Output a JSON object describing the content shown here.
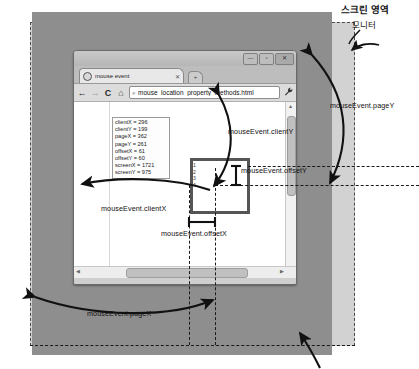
{
  "annotations": {
    "screen_area_label": "스크린 영역",
    "monitor_label": "모니터",
    "clientY": "mouseEvent.clientY",
    "clientX": "mouseEvent.clientX",
    "offsetY": "mouseEvent.offsetY",
    "offsetX": "mouseEvent.offsetX",
    "pageY": "mouseEvent.pageY",
    "pageX": "mouseEvent.pageX"
  },
  "browser": {
    "window_buttons": {
      "minimize": "—",
      "maximize": "▫",
      "close": "✕"
    },
    "tab": {
      "title": "mouse event",
      "close": "✕",
      "new_tab": "+"
    },
    "toolbar": {
      "back": "←",
      "forward": "→",
      "reload": "C",
      "home": "⌂",
      "url_icon": "⌕",
      "url": "mouse_location_property_methods.html",
      "wrench": "🔧"
    },
    "scrollbars": {
      "up": "▲",
      "down": "▼",
      "left": "◀",
      "right": "▶"
    }
  },
  "readout": {
    "lines": [
      "clientX = 296",
      "clientY = 199",
      "pageX = 362",
      "pageY = 261",
      "offsetX = 61",
      "offsetY = 60",
      "screenX = 1721",
      "screenY = 975"
    ]
  },
  "target_element": {
    "lines": [
      "1",
      "2",
      "3",
      "4"
    ]
  },
  "colors": {
    "screen_area": "#d2d2d2",
    "page_area": "#8e8e8e",
    "browser_chrome": "#cfcfcf",
    "target_border": "#555555",
    "guide_line": "#1a1a1a"
  }
}
